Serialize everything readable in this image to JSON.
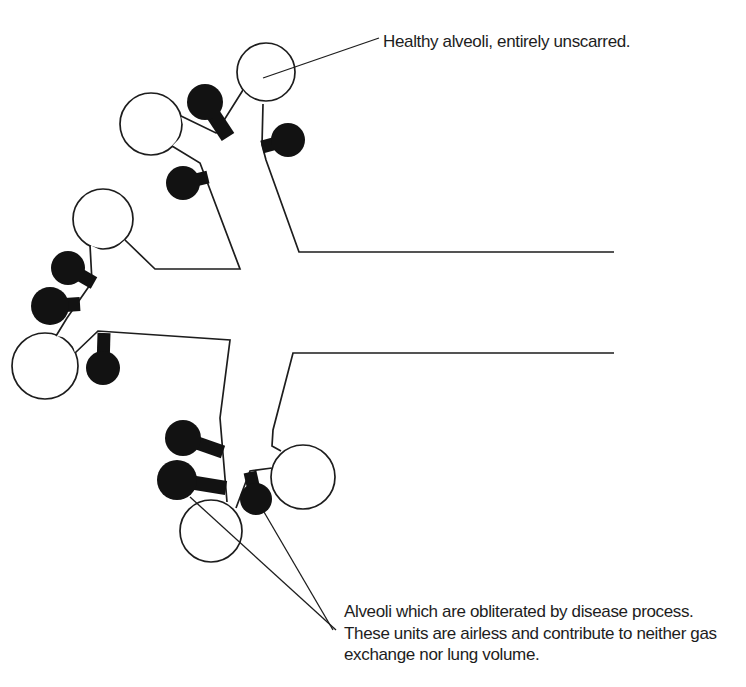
{
  "colors": {
    "ink": "#1d1d1d",
    "background": "#ffffff",
    "healthy_alveolus_fill": "#ffffff",
    "obliterated_alveolus_fill": "#121212"
  },
  "diagram": {
    "healthy_label": "Healthy alveoli, entirely unscarred.",
    "obliterated_label_lines": [
      "Alveoli which are obliterated by disease process.",
      "These units are airless and contribute to neither gas",
      "exchange nor lung volume."
    ],
    "healthy_alveoli_count": 6,
    "obliterated_alveoli_count": 9
  }
}
